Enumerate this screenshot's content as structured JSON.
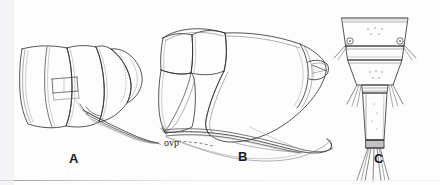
{
  "plate": {
    "width": 440,
    "height": 185,
    "background_color": "#fdfdfd",
    "ink_color": "#2b2b2b",
    "faint_ink_color": "#8a8a8a",
    "caption_color": "#1a1a1a",
    "type": "scientific-line-drawing-plate",
    "subject": "insect abdomen and ovipositor morphology"
  },
  "figures": [
    {
      "id": "A",
      "label": "A",
      "label_x": 69,
      "label_y": 152,
      "description": "lateral view of abdomen apex with ovipositor"
    },
    {
      "id": "B",
      "label": "B",
      "label_x": 238,
      "label_y": 150,
      "description": "enlarged lateral view of abdomen segments with ovipositor blade"
    },
    {
      "id": "C",
      "label": "C",
      "label_x": 374,
      "label_y": 152,
      "description": "dorsal view of terminal abdominal segments with setae"
    }
  ],
  "annotations": [
    {
      "id": "ovp",
      "text": "ovp",
      "x": 166,
      "y": 143,
      "meaning": "ovipositor",
      "leader_style": "dashed",
      "points_to": [
        "A",
        "B"
      ]
    }
  ]
}
